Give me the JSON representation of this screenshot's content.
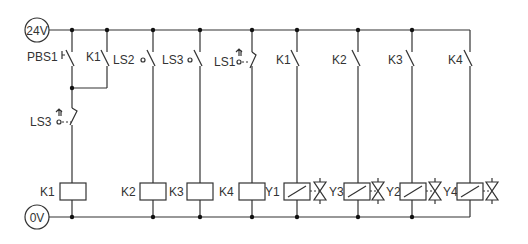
{
  "diagram": {
    "type": "ladder-wiring-diagram",
    "supply_top": "24V",
    "supply_bottom": "0V",
    "contacts": [
      {
        "label": "PBS1",
        "type": "pushbutton-NO",
        "rung": 1
      },
      {
        "label": "K1",
        "type": "NO-holding",
        "rung": 1
      },
      {
        "label": "LS3",
        "type": "limit-switch-NC",
        "rung": 1
      },
      {
        "label": "LS2",
        "type": "limit-switch-NO",
        "rung": 2
      },
      {
        "label": "LS3",
        "type": "limit-switch-NO",
        "rung": 3
      },
      {
        "label": "LS1",
        "type": "limit-switch-NC",
        "rung": 4
      },
      {
        "label": "K1",
        "type": "NO",
        "rung": 5
      },
      {
        "label": "K2",
        "type": "NO",
        "rung": 6
      },
      {
        "label": "K3",
        "type": "NO",
        "rung": 7
      },
      {
        "label": "K4",
        "type": "NO",
        "rung": 8
      }
    ],
    "coils": [
      {
        "label": "K1",
        "rung": 1
      },
      {
        "label": "K2",
        "rung": 2
      },
      {
        "label": "K3",
        "rung": 3
      },
      {
        "label": "K4",
        "rung": 4
      },
      {
        "label": "Y1",
        "type": "solenoid",
        "rung": 5
      },
      {
        "label": "Y3",
        "type": "solenoid",
        "rung": 6
      },
      {
        "label": "Y2",
        "type": "solenoid",
        "rung": 7
      },
      {
        "label": "Y4",
        "type": "solenoid",
        "rung": 8
      }
    ],
    "valve_labels": [
      "Y1",
      "Y3",
      "Y2",
      "Y4"
    ]
  },
  "labels": {
    "v24": "24V",
    "v0": "0V",
    "pbs1": "PBS1",
    "k1_hold": "K1",
    "ls3_nc": "LS3",
    "ls2": "LS2",
    "ls3": "LS3",
    "ls1": "LS1",
    "k1c": "K1",
    "k2c": "K2",
    "k3c": "K3",
    "k4c": "K4",
    "coil_k1": "K1",
    "coil_k2": "K2",
    "coil_k3": "K3",
    "coil_k4": "K4",
    "coil_y1": "Y1",
    "coil_y3": "Y3",
    "coil_y2": "Y2",
    "coil_y4": "Y4"
  }
}
